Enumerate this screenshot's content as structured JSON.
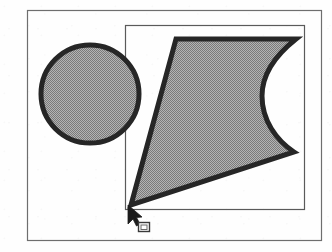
{
  "figure": {
    "background_color": "#fefefe",
    "stroke_color": "#262626",
    "fill_color": "#999999",
    "frame_color": "#6e6e6e",
    "clip_rect_color": "#5a5a5a",
    "cursor_color": "#1c1c1c"
  },
  "outer_frame": {
    "name": "figure-border",
    "x": 27,
    "y": 10,
    "width": 295,
    "height": 231,
    "stroke_width": 1.2
  },
  "clip_rect": {
    "name": "clipping-rectangle",
    "x": 125,
    "y": 25,
    "width": 180,
    "height": 185,
    "stroke_width": 1.2,
    "label": "clip region"
  },
  "circle_shape": {
    "name": "circle-shape",
    "cx": 90,
    "cy": 94,
    "r": 50,
    "stroke_width": 5,
    "fill": "#9a9a9a",
    "label": "circle"
  },
  "polygon_shape": {
    "name": "polygon-shape",
    "stroke_width": 5,
    "fill": "#9a9a9a",
    "label": "concave polygon",
    "path": "M 176 39 L 296 39 C 272 58 262 76 262 96 C 262 120 276 140 294 152 L 131 205 Z",
    "vertices": [
      {
        "x": 176,
        "y": 39
      },
      {
        "x": 296,
        "y": 39
      },
      {
        "x": 294,
        "y": 152
      },
      {
        "x": 131,
        "y": 205
      }
    ],
    "concave_edge": {
      "from": {
        "x": 296,
        "y": 39
      },
      "to": {
        "x": 294,
        "y": 152
      },
      "apex": {
        "x": 262,
        "y": 96
      }
    }
  },
  "cursor": {
    "name": "mouse-pointer",
    "x": 128,
    "y": 206,
    "width": 13,
    "height": 19,
    "label": "arrow pointer"
  },
  "handle": {
    "name": "selection-handle",
    "x": 138,
    "y": 222,
    "size": 11,
    "inner_size": 6,
    "label": "resize handle"
  }
}
